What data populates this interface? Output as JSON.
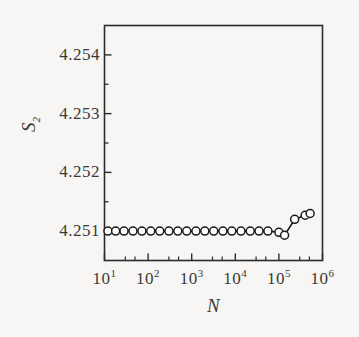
{
  "chart_data": {
    "type": "line",
    "title": "",
    "xlabel": "N",
    "ylabel": "S_2",
    "xscale": "log",
    "xlim": [
      10,
      1000000
    ],
    "ylim": [
      4.2505,
      4.2545
    ],
    "grid": false,
    "legend": null,
    "marker": "open-circle",
    "line_color": "#1a1a1a",
    "marker_face_color": "#ffffff",
    "x": [
      12,
      18,
      28,
      45,
      72,
      115,
      185,
      300,
      480,
      770,
      1250,
      2000,
      3200,
      5200,
      8300,
      13500,
      22000,
      35000,
      56000,
      100000,
      135000,
      230000,
      400000,
      520000
    ],
    "y": [
      4.251,
      4.251,
      4.251,
      4.251,
      4.251,
      4.251,
      4.251,
      4.251,
      4.251,
      4.251,
      4.251,
      4.251,
      4.251,
      4.251,
      4.251,
      4.251,
      4.251,
      4.251,
      4.251,
      4.25098,
      4.25093,
      4.2512,
      4.25127,
      4.2513
    ],
    "xticks": [
      {
        "value": 10,
        "label_base": "10",
        "label_exp": "1"
      },
      {
        "value": 100,
        "label_base": "10",
        "label_exp": "2"
      },
      {
        "value": 1000,
        "label_base": "10",
        "label_exp": "3"
      },
      {
        "value": 10000,
        "label_base": "10",
        "label_exp": "4"
      },
      {
        "value": 100000,
        "label_base": "10",
        "label_exp": "5"
      },
      {
        "value": 1000000,
        "label_base": "10",
        "label_exp": "6"
      }
    ],
    "yticks": [
      {
        "value": 4.251,
        "label": "4.251"
      },
      {
        "value": 4.252,
        "label": "4.252"
      },
      {
        "value": 4.253,
        "label": "4.253"
      },
      {
        "value": 4.254,
        "label": "4.254"
      }
    ],
    "yminorticks": [
      4.2515,
      4.2525,
      4.2535
    ],
    "axis_label_y_base": "S",
    "axis_label_y_sub": "2",
    "axis_label_x": "N"
  }
}
